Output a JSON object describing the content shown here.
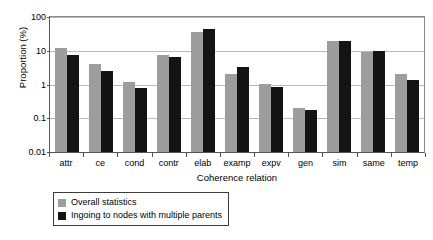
{
  "chart_data": {
    "type": "bar",
    "title": "",
    "xlabel": "Coherence relation",
    "ylabel": "Proportion (%)",
    "yscale": "log",
    "ylim": [
      0.01,
      100
    ],
    "yticks": [
      0.01,
      0.1,
      1,
      10,
      100
    ],
    "ytick_labels": [
      "0.01",
      "0.1",
      "1",
      "10",
      "100"
    ],
    "grid": true,
    "legend_position": "below-left",
    "categories": [
      "attr",
      "ce",
      "cond",
      "contr",
      "elab",
      "examp",
      "expv",
      "gen",
      "sim",
      "same",
      "temp"
    ],
    "series": [
      {
        "name": "Overall statistics",
        "color": "#9d9d9d",
        "values": [
          12.0,
          4.1,
          1.2,
          7.5,
          35.0,
          2.1,
          1.05,
          0.2,
          19.0,
          9.5,
          2.0
        ]
      },
      {
        "name": "Ingoing to nodes with multiple parents",
        "color": "#141414",
        "values": [
          7.5,
          2.6,
          0.8,
          6.7,
          43.0,
          3.2,
          0.85,
          0.17,
          19.5,
          10.0,
          1.35
        ]
      }
    ]
  },
  "legend": {
    "items": [
      {
        "label": "Overall statistics"
      },
      {
        "label": "Ingoing to nodes with multiple parents"
      }
    ]
  }
}
